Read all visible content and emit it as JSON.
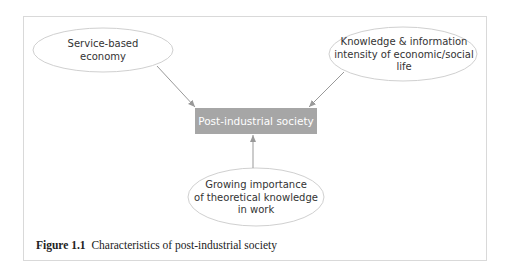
{
  "diagram": {
    "center_node": "Post-industrial society",
    "nodes": [
      {
        "id": "service",
        "label_lines": [
          "Service-based",
          "economy"
        ]
      },
      {
        "id": "knowledge",
        "label_lines": [
          "Knowledge & information",
          "intensity of economic/social",
          "life"
        ]
      },
      {
        "id": "theory",
        "label_lines": [
          "Growing importance",
          "of theoretical knowledge",
          "in work"
        ]
      }
    ],
    "edges": [
      {
        "from": "service",
        "to": "center"
      },
      {
        "from": "knowledge",
        "to": "center"
      },
      {
        "from": "theory",
        "to": "center"
      }
    ],
    "colors": {
      "box_fill": "#a6a6a6",
      "box_text": "#ffffff",
      "ellipse_stroke": "#cccccc",
      "arrow": "#999999"
    }
  },
  "caption": {
    "label": "Figure 1.1",
    "text": "Characteristics of post-industrial society"
  }
}
